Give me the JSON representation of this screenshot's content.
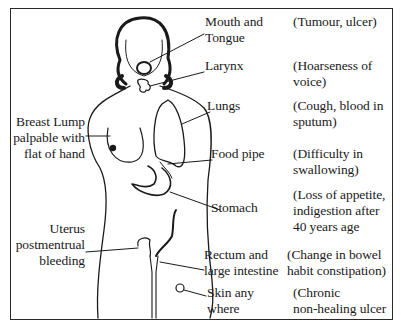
{
  "diagram": {
    "type": "annotated body illustration",
    "organs": [
      {
        "label_lines": [
          "Mouth and",
          "Tongue"
        ],
        "symptom_lines": [
          "(Tumour, ulcer)"
        ]
      },
      {
        "label_lines": [
          "Larynx"
        ],
        "symptom_lines": [
          "(Hoarseness of",
          "voice)"
        ]
      },
      {
        "label_lines": [
          "Lungs"
        ],
        "symptom_lines": [
          "(Cough, blood in",
          "sputum)"
        ]
      },
      {
        "label_lines": [
          "Food pipe"
        ],
        "symptom_lines": [
          "(Difficulty in",
          "swallowing)"
        ]
      },
      {
        "label_lines": [
          "Stomach"
        ],
        "symptom_lines": [
          "(Loss of appetite,",
          "indigestion after",
          "40 years age"
        ]
      },
      {
        "label_lines": [
          "Rectum and",
          "large intestine"
        ],
        "symptom_lines": [
          "(Change in bowel",
          "habit constipation)"
        ]
      },
      {
        "label_lines": [
          "Skin any",
          "where"
        ],
        "symptom_lines": [
          "(Chronic",
          "non-healing ulcer"
        ]
      }
    ],
    "left_labels": [
      {
        "lines": [
          "Breast Lump",
          "palpable with",
          "flat of hand"
        ]
      },
      {
        "lines": [
          "Uterus",
          "postmentrual",
          "bleeding"
        ]
      }
    ]
  }
}
